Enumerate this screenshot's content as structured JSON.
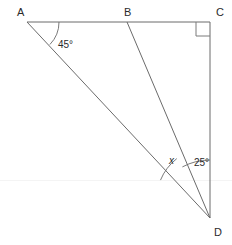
{
  "figure": {
    "kind": "geometry-diagram",
    "background_color": "#ffffff",
    "line_color": "#6b6b6b",
    "text_color": "#2b2b2b",
    "vertices": [
      {
        "id": "A",
        "label": "A",
        "x": 27,
        "y": 22,
        "label_x": 17,
        "label_y": 16
      },
      {
        "id": "B",
        "label": "B",
        "x": 127,
        "y": 22,
        "label_x": 124,
        "label_y": 16
      },
      {
        "id": "C",
        "label": "C",
        "x": 210,
        "y": 22,
        "label_x": 216,
        "label_y": 16
      },
      {
        "id": "D",
        "label": "D",
        "x": 210,
        "y": 218,
        "label_x": 214,
        "label_y": 236
      }
    ],
    "segments": [
      {
        "name": "segment-AC",
        "from": "A",
        "to": "C"
      },
      {
        "name": "segment-CD",
        "from": "C",
        "to": "D"
      },
      {
        "name": "segment-AD",
        "from": "A",
        "to": "D"
      },
      {
        "name": "segment-BD",
        "from": "B",
        "to": "D"
      }
    ],
    "angles": [
      {
        "name": "angle-at-A",
        "vertex": "A",
        "label": "45°",
        "value": 45,
        "unit": "degrees",
        "label_x": 58,
        "label_y": 48,
        "arc_radius": 32
      },
      {
        "name": "angle-ADB",
        "vertex": "D",
        "label": "x",
        "value": null,
        "unit": "unknown",
        "label_x": 169,
        "label_y": 164,
        "arc_radius": 53
      },
      {
        "name": "angle-BDC",
        "vertex": "D",
        "label": "25°",
        "value": 25,
        "unit": "degrees",
        "label_x": 194,
        "label_y": 166,
        "arc_radius": 58
      }
    ],
    "right_angle": {
      "name": "right-angle-at-C",
      "vertex": "C",
      "marker": "square",
      "size": 14
    }
  }
}
